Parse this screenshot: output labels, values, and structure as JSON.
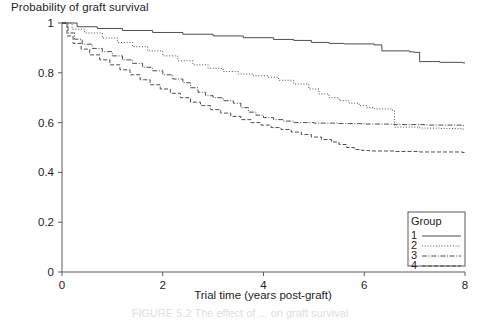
{
  "figure": {
    "ylabel": "Probability of graft survival",
    "xlabel": "Trial time (years post-graft)",
    "caption": "FIGURE 5.2  The effect of ... on graft survival",
    "legend_title": "Group"
  },
  "colors": {
    "ink": "#3a3a3a",
    "axis": "#5a5a5a",
    "text": "#1d1d1d",
    "caption": "#8d8d8d",
    "background": "#ffffff"
  },
  "axes": {
    "x_ticks": [
      "0",
      "2",
      "4",
      "6",
      "8"
    ],
    "x_tick_values": [
      0,
      2,
      4,
      6,
      8
    ],
    "y_ticks": [
      "0",
      "0.2",
      "0.4",
      "0.6",
      "0.8",
      "1"
    ],
    "y_tick_values": [
      0,
      0.2,
      0.4,
      0.6,
      0.8,
      1.0
    ]
  },
  "chart_data": {
    "type": "line",
    "title": "",
    "xlabel": "Trial time (years post-graft)",
    "ylabel": "Probability of graft survival",
    "xlim": [
      0,
      8
    ],
    "ylim": [
      0,
      1
    ],
    "grid": false,
    "legend_position": "bottom-right",
    "legend_title": "Group",
    "step_style": "kaplan-meier step function",
    "series": [
      {
        "name": "1",
        "label": "1",
        "dash": "none",
        "final_value": 0.84,
        "points": [
          [
            0.0,
            1.0
          ],
          [
            0.3,
            0.985
          ],
          [
            0.7,
            0.978
          ],
          [
            1.2,
            0.97
          ],
          [
            1.8,
            0.962
          ],
          [
            2.4,
            0.955
          ],
          [
            3.0,
            0.948
          ],
          [
            3.6,
            0.941
          ],
          [
            4.2,
            0.934
          ],
          [
            4.6,
            0.93
          ],
          [
            4.95,
            0.922
          ],
          [
            5.3,
            0.918
          ],
          [
            5.6,
            0.916
          ],
          [
            6.2,
            0.912
          ],
          [
            6.35,
            0.888
          ],
          [
            6.9,
            0.884
          ],
          [
            7.0,
            0.882
          ],
          [
            7.1,
            0.845
          ],
          [
            7.5,
            0.842
          ],
          [
            7.95,
            0.84
          ]
        ]
      },
      {
        "name": "2",
        "label": "2",
        "dash": "dotted",
        "final_value": 0.54,
        "points": [
          [
            0.0,
            1.0
          ],
          [
            0.2,
            0.975
          ],
          [
            0.45,
            0.96
          ],
          [
            0.8,
            0.94
          ],
          [
            1.1,
            0.922
          ],
          [
            1.4,
            0.905
          ],
          [
            1.7,
            0.888
          ],
          [
            2.0,
            0.868
          ],
          [
            2.3,
            0.848
          ],
          [
            2.6,
            0.832
          ],
          [
            2.9,
            0.818
          ],
          [
            3.2,
            0.805
          ],
          [
            3.5,
            0.795
          ],
          [
            3.8,
            0.788
          ],
          [
            4.1,
            0.782
          ],
          [
            4.3,
            0.77
          ],
          [
            4.6,
            0.755
          ],
          [
            4.9,
            0.735
          ],
          [
            5.1,
            0.715
          ],
          [
            5.3,
            0.7
          ],
          [
            5.5,
            0.688
          ],
          [
            5.7,
            0.678
          ],
          [
            5.9,
            0.668
          ],
          [
            6.05,
            0.66
          ],
          [
            6.2,
            0.655
          ],
          [
            6.55,
            0.65
          ],
          [
            6.6,
            0.582
          ],
          [
            7.1,
            0.578
          ],
          [
            7.5,
            0.576
          ],
          [
            7.95,
            0.574
          ]
        ]
      },
      {
        "name": "3",
        "label": "3",
        "dash": "dashdot",
        "final_value": 0.49,
        "points": [
          [
            0.0,
            1.0
          ],
          [
            0.12,
            0.96
          ],
          [
            0.25,
            0.935
          ],
          [
            0.4,
            0.915
          ],
          [
            0.6,
            0.898
          ],
          [
            0.8,
            0.885
          ],
          [
            1.0,
            0.868
          ],
          [
            1.2,
            0.852
          ],
          [
            1.4,
            0.838
          ],
          [
            1.6,
            0.822
          ],
          [
            1.8,
            0.808
          ],
          [
            2.0,
            0.792
          ],
          [
            2.2,
            0.775
          ],
          [
            2.4,
            0.76
          ],
          [
            2.55,
            0.74
          ],
          [
            2.7,
            0.722
          ],
          [
            2.85,
            0.708
          ],
          [
            3.0,
            0.7
          ],
          [
            3.2,
            0.688
          ],
          [
            3.4,
            0.678
          ],
          [
            3.55,
            0.66
          ],
          [
            3.7,
            0.642
          ],
          [
            3.85,
            0.63
          ],
          [
            4.0,
            0.62
          ],
          [
            4.2,
            0.612
          ],
          [
            4.4,
            0.606
          ],
          [
            4.6,
            0.6
          ],
          [
            5.0,
            0.598
          ],
          [
            5.5,
            0.596
          ],
          [
            6.0,
            0.594
          ],
          [
            6.6,
            0.592
          ],
          [
            7.2,
            0.59
          ],
          [
            7.95,
            0.588
          ]
        ]
      },
      {
        "name": "4",
        "label": "4",
        "dash": "dashed",
        "final_value": 0.42,
        "points": [
          [
            0.0,
            1.0
          ],
          [
            0.1,
            0.948
          ],
          [
            0.22,
            0.918
          ],
          [
            0.38,
            0.895
          ],
          [
            0.55,
            0.872
          ],
          [
            0.75,
            0.852
          ],
          [
            0.95,
            0.832
          ],
          [
            1.15,
            0.812
          ],
          [
            1.35,
            0.792
          ],
          [
            1.55,
            0.772
          ],
          [
            1.75,
            0.752
          ],
          [
            1.95,
            0.735
          ],
          [
            2.15,
            0.718
          ],
          [
            2.35,
            0.7
          ],
          [
            2.55,
            0.682
          ],
          [
            2.75,
            0.668
          ],
          [
            2.95,
            0.652
          ],
          [
            3.15,
            0.638
          ],
          [
            3.35,
            0.625
          ],
          [
            3.55,
            0.612
          ],
          [
            3.75,
            0.6
          ],
          [
            3.95,
            0.59
          ],
          [
            4.15,
            0.58
          ],
          [
            4.35,
            0.572
          ],
          [
            4.55,
            0.562
          ],
          [
            4.75,
            0.552
          ],
          [
            4.95,
            0.542
          ],
          [
            5.15,
            0.532
          ],
          [
            5.35,
            0.522
          ],
          [
            5.5,
            0.512
          ],
          [
            5.65,
            0.5
          ],
          [
            5.8,
            0.492
          ],
          [
            5.95,
            0.488
          ],
          [
            6.1,
            0.486
          ],
          [
            6.6,
            0.484
          ],
          [
            7.1,
            0.482
          ],
          [
            7.95,
            0.48
          ]
        ]
      }
    ]
  },
  "legend": {
    "title": "Group",
    "entries": [
      {
        "label": "1",
        "dash": "none"
      },
      {
        "label": "2",
        "dash": "dotted"
      },
      {
        "label": "3",
        "dash": "dashdot"
      },
      {
        "label": "4",
        "dash": "dashed"
      }
    ]
  }
}
